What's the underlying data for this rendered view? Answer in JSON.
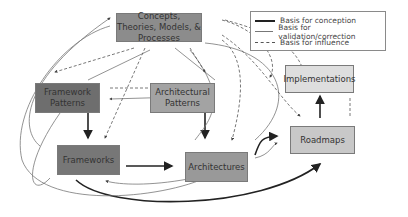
{
  "nodes": {
    "concepts": {
      "label": "Concepts, Theories, Models, & Processes",
      "color": "#8c8c8c"
    },
    "framework_patterns": {
      "label": "Framework Patterns",
      "color": "#6e6e6e"
    },
    "architectural_patterns": {
      "label": "Architectural Patterns",
      "color": "#a3a3a3"
    },
    "frameworks": {
      "label": "Frameworks",
      "color": "#777777"
    },
    "architectures": {
      "label": "Architectures",
      "color": "#999999"
    },
    "implementations": {
      "label": "Implementations",
      "color": "#dedede"
    },
    "roadmaps": {
      "label": "Roadmaps",
      "color": "#c8c8c8"
    }
  },
  "legend": {
    "items": [
      {
        "label": "Basis for conception",
        "style": "thick-solid"
      },
      {
        "label": "Basis for validation/correction",
        "style": "thin-solid"
      },
      {
        "label": "Basis for influence",
        "style": "dashed"
      }
    ]
  }
}
